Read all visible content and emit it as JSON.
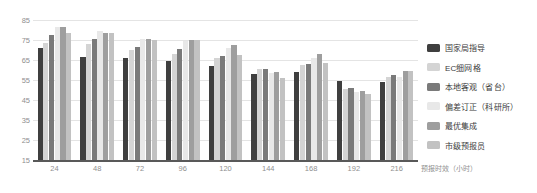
{
  "chart_data": {
    "type": "bar",
    "title": "",
    "xlabel": "预报时效（小时）",
    "ylabel": "",
    "categories": [
      "24",
      "48",
      "72",
      "96",
      "120",
      "144",
      "168",
      "192",
      "216"
    ],
    "ylim": [
      15,
      85
    ],
    "yticks": [
      15,
      25,
      35,
      45,
      55,
      65,
      75,
      85
    ],
    "grid": true,
    "legend_position": "right",
    "series": [
      {
        "name": "国家局指导",
        "color": "#3f3f3f",
        "values": [
          71,
          66.5,
          66.2,
          64.5,
          62.2,
          58,
          59,
          54.5,
          54
        ]
      },
      {
        "name": "EC细网格",
        "color": "#d4d4d4",
        "values": [
          73.5,
          73,
          70,
          68,
          66,
          60.5,
          62.5,
          50.5,
          56.5
        ]
      },
      {
        "name": "本地客观（省台）",
        "color": "#7a7a7a",
        "values": [
          77.5,
          75.5,
          71.5,
          70.5,
          67,
          60.5,
          63.2,
          51,
          57.5
        ]
      },
      {
        "name": "偏差订正（科研所）",
        "color": "#e8e8e8",
        "values": [
          81.5,
          79.5,
          75.5,
          74.5,
          71,
          58.5,
          66,
          49,
          56.5
        ]
      },
      {
        "name": "最优集成",
        "color": "#9e9e9e",
        "values": [
          81.5,
          78.5,
          75.5,
          75,
          72.5,
          59,
          68,
          49.5,
          59.5
        ]
      },
      {
        "name": "市级预报员",
        "color": "#c2c2c2",
        "values": [
          78.5,
          78.5,
          75,
          75,
          67.5,
          56,
          63.5,
          48,
          59.5
        ]
      }
    ]
  }
}
